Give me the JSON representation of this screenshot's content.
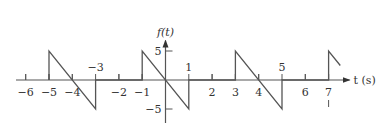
{
  "chart_data": {
    "type": "line",
    "title": "",
    "xlabel": "t (s)",
    "ylabel": "f(t)",
    "xlim": [
      -7,
      8
    ],
    "ylim": [
      -7,
      7
    ],
    "grid": false,
    "x_ticks": [
      {
        "value": -6,
        "label": "−6",
        "pos": "below"
      },
      {
        "value": -5,
        "label": "−5",
        "pos": "below"
      },
      {
        "value": -4,
        "label": "−4",
        "pos": "below"
      },
      {
        "value": -3,
        "label": "−3",
        "pos": "above"
      },
      {
        "value": -2,
        "label": "−2",
        "pos": "below"
      },
      {
        "value": -1,
        "label": "−1",
        "pos": "below"
      },
      {
        "value": 1,
        "label": "1",
        "pos": "above"
      },
      {
        "value": 2,
        "label": "2",
        "pos": "below"
      },
      {
        "value": 3,
        "label": "3",
        "pos": "below"
      },
      {
        "value": 4,
        "label": "4",
        "pos": "below"
      },
      {
        "value": 5,
        "label": "5",
        "pos": "above"
      },
      {
        "value": 6,
        "label": "6",
        "pos": "below"
      },
      {
        "value": 7,
        "label": "7",
        "pos": "below"
      }
    ],
    "y_ticks": [
      {
        "value": 5,
        "label": "5"
      },
      {
        "value": -5,
        "label": "−5"
      }
    ],
    "series": [
      {
        "name": "f(t) sawtooth, period 4",
        "points": [
          [
            -5,
            0
          ],
          [
            -5,
            5
          ],
          [
            -3,
            -5
          ],
          [
            -3,
            0
          ],
          [
            -1,
            0
          ],
          [
            -1,
            5
          ],
          [
            1,
            -5
          ],
          [
            1,
            0
          ],
          [
            3,
            0
          ],
          [
            3,
            5
          ],
          [
            5,
            -5
          ],
          [
            5,
            0
          ],
          [
            7,
            0
          ],
          [
            7,
            5
          ],
          [
            7.5,
            2.5
          ]
        ]
      }
    ]
  }
}
